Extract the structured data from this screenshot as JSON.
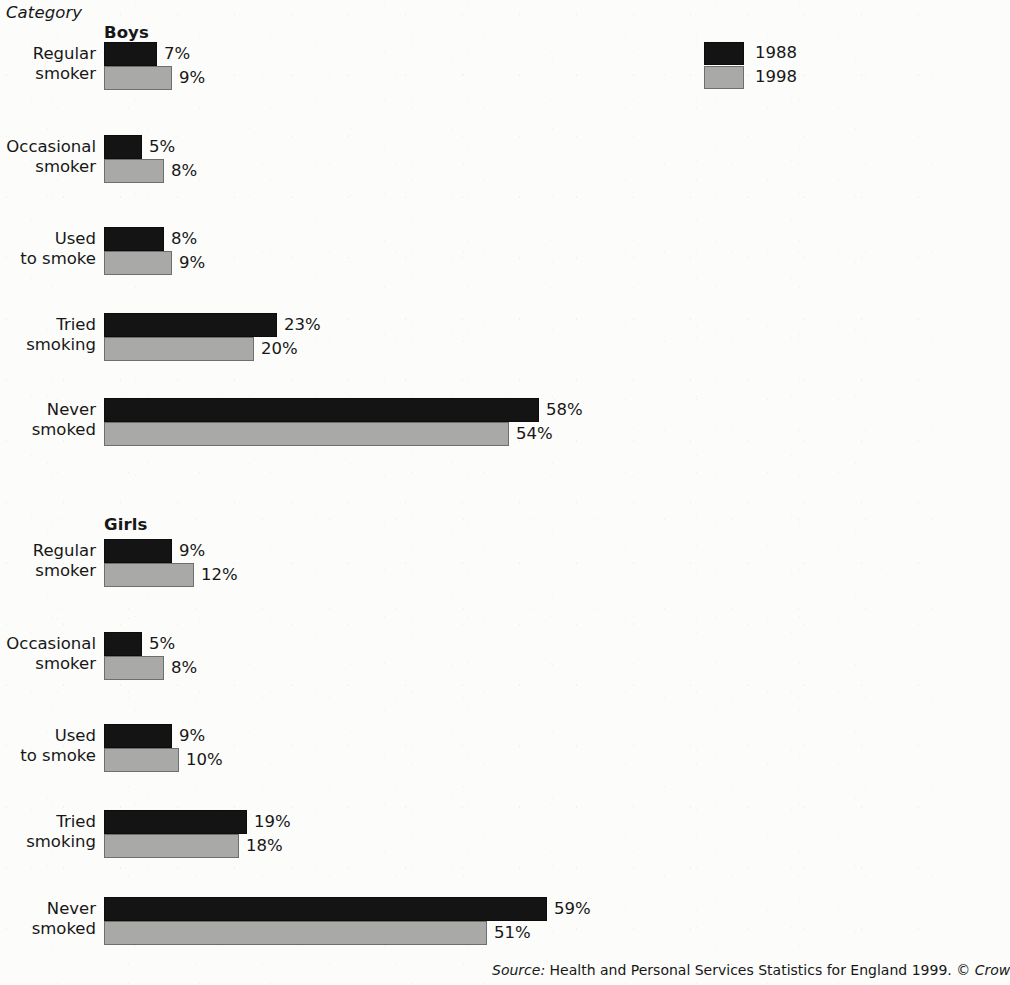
{
  "header": {
    "category_label": "Category"
  },
  "legend": {
    "position": "top-right",
    "items": [
      {
        "label": "1988",
        "color": "#141414",
        "swatch": "black-swatch"
      },
      {
        "label": "1998",
        "color": "#a9a9a7",
        "swatch": "gray-swatch"
      }
    ]
  },
  "source": {
    "prefix": "Source:",
    "text": "Health and Personal Services Statistics for England 1999.",
    "copyright": "© Crow"
  },
  "chart_data": {
    "type": "bar",
    "orientation": "horizontal",
    "title": "",
    "xlabel": "",
    "ylabel": "Category",
    "value_suffix": "%",
    "xlim": [
      0,
      60
    ],
    "grid": false,
    "legend_position": "top-right",
    "series": [
      {
        "name": "1988",
        "color": "#141414"
      },
      {
        "name": "1998",
        "color": "#a9a9a7"
      }
    ],
    "groups": [
      {
        "name": "Boys",
        "categories": [
          "Regular smoker",
          "Occasional smoker",
          "Used to smoke",
          "Tried smoking",
          "Never smoked"
        ],
        "series": [
          {
            "name": "1988",
            "values": [
              7,
              5,
              8,
              23,
              58
            ]
          },
          {
            "name": "1998",
            "values": [
              9,
              8,
              9,
              20,
              54
            ]
          }
        ]
      },
      {
        "name": "Girls",
        "categories": [
          "Regular smoker",
          "Occasional smoker",
          "Used to smoke",
          "Tried smoking",
          "Never smoked"
        ],
        "series": [
          {
            "name": "1988",
            "values": [
              9,
              5,
              9,
              19,
              59
            ]
          },
          {
            "name": "1998",
            "values": [
              12,
              8,
              10,
              18,
              51
            ]
          }
        ]
      }
    ]
  },
  "layout": {
    "px_per_percent": 7.5,
    "bar_origin_x": 104,
    "group_title_x": 104,
    "group_tops": [
      23,
      515
    ],
    "row_tops": [
      [
        42,
        135,
        227,
        313,
        398
      ],
      [
        539,
        632,
        724,
        810,
        897
      ]
    ]
  }
}
